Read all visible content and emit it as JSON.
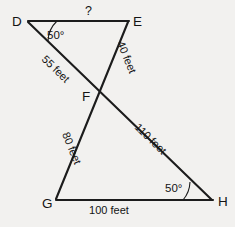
{
  "figure": {
    "background_color": "#f2f1ef",
    "line_color": "#1c1c1c",
    "unit": "feet"
  },
  "vertices": {
    "D": {
      "label": "D",
      "x": 25,
      "y": 20
    },
    "E": {
      "label": "E",
      "x": 129,
      "y": 20
    },
    "F": {
      "label": "F",
      "x": 98,
      "y": 95
    },
    "G": {
      "label": "G",
      "x": 55,
      "y": 200
    },
    "H": {
      "label": "H",
      "x": 212,
      "y": 200
    }
  },
  "segments": {
    "DE": {
      "label": "?",
      "from": "D",
      "to": "E"
    },
    "DF": {
      "label": "55 feet",
      "from": "D",
      "to": "F"
    },
    "EF": {
      "label": "40 feet",
      "from": "E",
      "to": "F"
    },
    "FG": {
      "label": "80 feet",
      "from": "F",
      "to": "G"
    },
    "FH": {
      "label": "110 feet",
      "from": "F",
      "to": "H"
    },
    "GH": {
      "label": "100 feet",
      "from": "G",
      "to": "H"
    }
  },
  "angles": {
    "D": {
      "label": "50°",
      "vertex": "D",
      "value": 50
    },
    "H": {
      "label": "50°",
      "vertex": "H",
      "value": 50
    }
  }
}
